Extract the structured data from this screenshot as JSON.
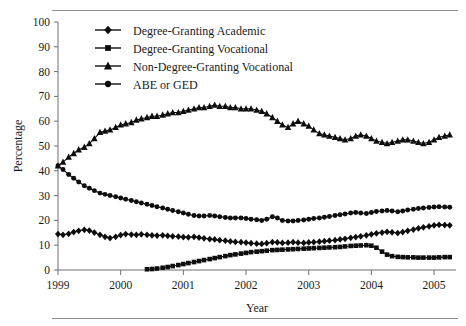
{
  "figure": {
    "has_top_rule": true,
    "has_bottom_rule": true,
    "background": "#ffffff",
    "ink_color": "#0d0d0d",
    "axis_color": "#6e6e6e"
  },
  "chart_data": {
    "type": "line",
    "title": "",
    "xlabel": "Year",
    "ylabel": "Percentage",
    "xlim": [
      1999,
      2005.35
    ],
    "ylim": [
      0,
      100
    ],
    "ytick_step": 10,
    "yticks": [
      0,
      10,
      20,
      30,
      40,
      50,
      60,
      70,
      80,
      90,
      100
    ],
    "xticks": [
      1999,
      2000,
      2001,
      2002,
      2003,
      2004,
      2005
    ],
    "xtick_labels": [
      "1999",
      "2000",
      "2001",
      "2002",
      "2003",
      "2004",
      "2005"
    ],
    "grid": false,
    "legend_position": "top-center",
    "series": [
      {
        "name": "Degree-Granting Academic",
        "marker": "diamond",
        "x": [
          1999.0,
          1999.08,
          1999.17,
          1999.25,
          1999.33,
          1999.42,
          1999.5,
          1999.58,
          1999.67,
          1999.75,
          1999.83,
          1999.92,
          2000.0,
          2000.08,
          2000.17,
          2000.25,
          2000.33,
          2000.42,
          2000.5,
          2000.58,
          2000.67,
          2000.75,
          2000.83,
          2000.92,
          2001.0,
          2001.08,
          2001.17,
          2001.25,
          2001.33,
          2001.42,
          2001.5,
          2001.58,
          2001.67,
          2001.75,
          2001.83,
          2001.92,
          2002.0,
          2002.08,
          2002.17,
          2002.25,
          2002.33,
          2002.42,
          2002.5,
          2002.58,
          2002.67,
          2002.75,
          2002.83,
          2002.92,
          2003.0,
          2003.08,
          2003.17,
          2003.25,
          2003.33,
          2003.42,
          2003.5,
          2003.58,
          2003.67,
          2003.75,
          2003.83,
          2003.92,
          2004.0,
          2004.08,
          2004.17,
          2004.25,
          2004.33,
          2004.42,
          2004.5,
          2004.58,
          2004.67,
          2004.75,
          2004.83,
          2004.92,
          2005.0,
          2005.08,
          2005.17,
          2005.25
        ],
        "y": [
          14.5,
          14.2,
          14.6,
          15.3,
          15.8,
          16.2,
          15.9,
          15.1,
          14.2,
          13.4,
          12.9,
          13.4,
          14.1,
          14.5,
          14.3,
          14.2,
          14.4,
          14.2,
          14.0,
          13.9,
          14.0,
          13.8,
          13.6,
          13.5,
          13.3,
          13.2,
          13.4,
          13.1,
          12.8,
          12.5,
          12.3,
          12.0,
          11.8,
          11.5,
          11.3,
          11.2,
          11.0,
          10.8,
          10.6,
          10.5,
          10.8,
          11.2,
          11.1,
          10.9,
          11.0,
          11.2,
          11.0,
          10.9,
          11.1,
          11.2,
          11.4,
          11.6,
          11.8,
          12.0,
          12.3,
          12.6,
          13.0,
          13.3,
          13.6,
          14.0,
          14.4,
          14.8,
          15.1,
          15.4,
          15.2,
          14.9,
          15.3,
          15.8,
          16.3,
          16.8,
          17.2,
          17.6,
          18.0,
          18.2,
          18.1,
          18.0
        ]
      },
      {
        "name": "Degree-Granting Vocational",
        "marker": "square",
        "x": [
          2000.42,
          2000.5,
          2000.58,
          2000.67,
          2000.75,
          2000.83,
          2000.92,
          2001.0,
          2001.08,
          2001.17,
          2001.25,
          2001.33,
          2001.42,
          2001.5,
          2001.58,
          2001.67,
          2001.75,
          2001.83,
          2001.92,
          2002.0,
          2002.08,
          2002.17,
          2002.25,
          2002.33,
          2002.42,
          2002.5,
          2002.58,
          2002.67,
          2002.75,
          2002.83,
          2002.92,
          2003.0,
          2003.08,
          2003.17,
          2003.25,
          2003.33,
          2003.42,
          2003.5,
          2003.58,
          2003.67,
          2003.75,
          2003.83,
          2003.92,
          2004.0,
          2004.08,
          2004.17,
          2004.25,
          2004.33,
          2004.42,
          2004.5,
          2004.58,
          2004.67,
          2004.75,
          2004.83,
          2004.92,
          2005.0,
          2005.08,
          2005.17,
          2005.25
        ],
        "y": [
          0.3,
          0.4,
          0.6,
          0.9,
          1.2,
          1.6,
          2.0,
          2.4,
          2.8,
          3.2,
          3.6,
          4.0,
          4.4,
          4.8,
          5.2,
          5.6,
          6.0,
          6.3,
          6.6,
          6.9,
          7.2,
          7.4,
          7.6,
          7.8,
          8.0,
          8.1,
          8.2,
          8.3,
          8.4,
          8.5,
          8.6,
          8.7,
          8.8,
          8.9,
          9.0,
          9.1,
          9.2,
          9.3,
          9.5,
          9.7,
          9.8,
          9.9,
          10.0,
          9.8,
          9.0,
          7.4,
          6.2,
          5.6,
          5.3,
          5.2,
          5.1,
          5.1,
          5.0,
          5.0,
          5.0,
          5.0,
          5.1,
          5.2,
          5.2
        ]
      },
      {
        "name": "Non-Degree-Granting Vocational",
        "marker": "triangle",
        "x": [
          1999.0,
          1999.08,
          1999.17,
          1999.25,
          1999.33,
          1999.42,
          1999.5,
          1999.58,
          1999.67,
          1999.75,
          1999.83,
          1999.92,
          2000.0,
          2000.08,
          2000.17,
          2000.25,
          2000.33,
          2000.42,
          2000.5,
          2000.58,
          2000.67,
          2000.75,
          2000.83,
          2000.92,
          2001.0,
          2001.08,
          2001.17,
          2001.25,
          2001.33,
          2001.42,
          2001.5,
          2001.58,
          2001.67,
          2001.75,
          2001.83,
          2001.92,
          2002.0,
          2002.08,
          2002.17,
          2002.25,
          2002.33,
          2002.42,
          2002.5,
          2002.58,
          2002.67,
          2002.75,
          2002.83,
          2002.92,
          2003.0,
          2003.08,
          2003.17,
          2003.25,
          2003.33,
          2003.42,
          2003.5,
          2003.58,
          2003.67,
          2003.75,
          2003.83,
          2003.92,
          2004.0,
          2004.08,
          2004.17,
          2004.25,
          2004.33,
          2004.42,
          2004.5,
          2004.58,
          2004.67,
          2004.75,
          2004.83,
          2004.92,
          2005.0,
          2005.08,
          2005.17,
          2005.25
        ],
        "y": [
          42.0,
          43.5,
          45.5,
          47.0,
          48.5,
          49.5,
          51.0,
          53.0,
          55.5,
          56.0,
          56.5,
          57.5,
          58.5,
          59.0,
          59.5,
          60.5,
          61.0,
          61.5,
          62.0,
          62.0,
          62.5,
          63.0,
          63.5,
          63.5,
          64.0,
          64.5,
          65.0,
          65.5,
          65.5,
          66.0,
          66.5,
          66.0,
          66.0,
          65.5,
          65.5,
          65.0,
          65.0,
          65.0,
          64.5,
          64.0,
          63.0,
          61.5,
          60.0,
          58.5,
          57.5,
          59.0,
          60.0,
          59.0,
          58.0,
          56.5,
          55.0,
          54.5,
          54.0,
          53.5,
          53.0,
          52.5,
          53.0,
          54.0,
          54.5,
          54.0,
          53.0,
          52.0,
          51.5,
          51.0,
          51.5,
          52.0,
          52.5,
          52.5,
          52.0,
          51.5,
          51.0,
          51.5,
          52.5,
          53.5,
          54.0,
          54.5
        ]
      },
      {
        "name": "ABE or GED",
        "marker": "circle",
        "x": [
          1999.0,
          1999.08,
          1999.17,
          1999.25,
          1999.33,
          1999.42,
          1999.5,
          1999.58,
          1999.67,
          1999.75,
          1999.83,
          1999.92,
          2000.0,
          2000.08,
          2000.17,
          2000.25,
          2000.33,
          2000.42,
          2000.5,
          2000.58,
          2000.67,
          2000.75,
          2000.83,
          2000.92,
          2001.0,
          2001.08,
          2001.17,
          2001.25,
          2001.33,
          2001.42,
          2001.5,
          2001.58,
          2001.67,
          2001.75,
          2001.83,
          2001.92,
          2002.0,
          2002.08,
          2002.17,
          2002.25,
          2002.33,
          2002.42,
          2002.5,
          2002.58,
          2002.67,
          2002.75,
          2002.83,
          2002.92,
          2003.0,
          2003.08,
          2003.17,
          2003.25,
          2003.33,
          2003.42,
          2003.5,
          2003.58,
          2003.67,
          2003.75,
          2003.83,
          2003.92,
          2004.0,
          2004.08,
          2004.17,
          2004.25,
          2004.33,
          2004.42,
          2004.5,
          2004.58,
          2004.67,
          2004.75,
          2004.83,
          2004.92,
          2005.0,
          2005.08,
          2005.17,
          2005.25
        ],
        "y": [
          42.0,
          40.5,
          38.5,
          37.0,
          35.5,
          34.0,
          33.0,
          32.0,
          31.0,
          30.5,
          30.0,
          29.5,
          29.0,
          28.5,
          28.0,
          27.5,
          27.0,
          26.5,
          26.0,
          25.5,
          25.0,
          24.5,
          24.0,
          23.5,
          23.0,
          22.5,
          22.0,
          21.8,
          21.8,
          22.0,
          21.8,
          21.5,
          21.2,
          21.0,
          21.0,
          21.0,
          20.8,
          20.5,
          20.3,
          20.0,
          20.5,
          21.5,
          21.0,
          20.0,
          19.8,
          19.8,
          20.0,
          20.2,
          20.5,
          20.8,
          21.0,
          21.3,
          21.6,
          22.0,
          22.3,
          22.6,
          23.0,
          23.2,
          23.0,
          22.8,
          23.2,
          23.6,
          23.8,
          24.0,
          23.8,
          23.5,
          23.8,
          24.2,
          24.5,
          24.8,
          25.0,
          25.2,
          25.4,
          25.5,
          25.4,
          25.3
        ]
      }
    ]
  },
  "axes": {
    "ylabel": "Percentage",
    "xlabel": "Year"
  },
  "legend": {
    "entries": [
      {
        "label": "Degree-Granting Academic",
        "marker": "diamond"
      },
      {
        "label": "Degree-Granting Vocational",
        "marker": "square"
      },
      {
        "label": "Non-Degree-Granting Vocational",
        "marker": "triangle"
      },
      {
        "label": "ABE or GED",
        "marker": "circle"
      }
    ]
  }
}
